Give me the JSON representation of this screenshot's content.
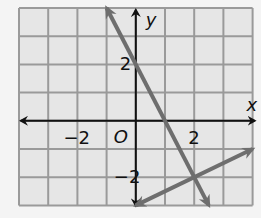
{
  "chart_data": {
    "type": "line",
    "title": "",
    "xlabel": "x",
    "ylabel": "y",
    "origin_label": "O",
    "xlim": [
      -4,
      4
    ],
    "ylim": [
      -3,
      4
    ],
    "grid": true,
    "x_tick_labels": [
      {
        "value": -2,
        "text": "−2"
      },
      {
        "value": 2,
        "text": "2"
      }
    ],
    "y_tick_labels": [
      {
        "value": 2,
        "text": "2"
      },
      {
        "value": -2,
        "text": "−2"
      }
    ],
    "series": [
      {
        "name": "line 1",
        "equation": "y = -2x + 2",
        "points": [
          [
            -1,
            4
          ],
          [
            2.5,
            -3
          ]
        ],
        "arrows": "both",
        "color": "#6e6e6e"
      },
      {
        "name": "line 2",
        "equation": "y = 0.5x - 3",
        "points": [
          [
            0,
            -3
          ],
          [
            4,
            -1
          ]
        ],
        "arrows": "both",
        "color": "#6e6e6e"
      }
    ],
    "intersection": [
      2,
      -2
    ]
  },
  "colors": {
    "grid_fill": "#e6e6e6",
    "grid_line": "#9a9a9a",
    "axis": "#111111",
    "line": "#6e6e6e"
  }
}
